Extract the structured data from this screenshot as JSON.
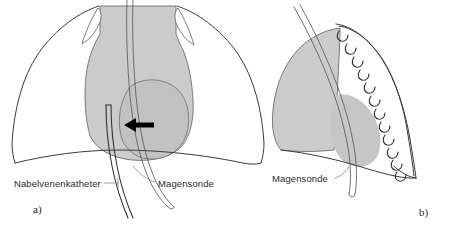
{
  "figure": {
    "type": "medical-illustration",
    "panels": [
      {
        "id": "a",
        "letter": "a)",
        "view": "frontal",
        "labels": [
          {
            "id": "umbilical-catheter",
            "text": "Nabelvenenkatheter"
          },
          {
            "id": "gastric-tube",
            "text": "Magensonde"
          }
        ],
        "annotations": [
          {
            "id": "tip-arrow",
            "icon": "arrow-left-icon",
            "points_to": "catheter tip"
          }
        ]
      },
      {
        "id": "b",
        "letter": "b)",
        "view": "lateral",
        "labels": [
          {
            "id": "gastric-tube",
            "text": "Magensonde"
          }
        ],
        "annotations": []
      }
    ]
  },
  "colors": {
    "background": "#ffffff",
    "outline": "#3b3b3b",
    "shade_light": "#cbcbcb",
    "shade_mid": "#c2c2c2",
    "tube_stroke": "#5a5a5a",
    "tube_stroke_dark": "#2e2e2e",
    "arrow": "#000000",
    "label_text": "#2b2b2b",
    "leader_line": "#8a8a8a"
  }
}
